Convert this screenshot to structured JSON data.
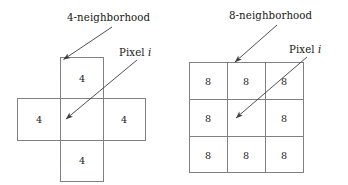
{
  "figure": {
    "background_color": "#ffffff",
    "line_color": "#808080",
    "arrow_color": "#3c3c3c",
    "text_color": "#161616"
  },
  "left_diagram": {
    "name": "4-neighborhood",
    "shape": "plus",
    "caption": "4-neighborhood",
    "pixel_caption_prefix": "Pixel ",
    "pixel_caption_symbol": "i",
    "center_value": "",
    "neighbor_value": "4",
    "cells": [
      {
        "position": "top",
        "label": "4"
      },
      {
        "position": "left",
        "label": "4"
      },
      {
        "position": "center",
        "label": ""
      },
      {
        "position": "right",
        "label": "4"
      },
      {
        "position": "bottom",
        "label": "4"
      }
    ],
    "annotations": [
      {
        "name": "neighborhood-arrow",
        "target": "top cell upper-left corner"
      },
      {
        "name": "pixel-arrow",
        "target": "center cell"
      }
    ]
  },
  "right_diagram": {
    "name": "8-neighborhood",
    "shape": "square-3x3",
    "caption": "8-neighborhood",
    "pixel_caption_prefix": "Pixel ",
    "pixel_caption_symbol": "i",
    "center_value": "",
    "neighbor_value": "8",
    "rows": [
      [
        "8",
        "8",
        "8"
      ],
      [
        "8",
        "",
        "8"
      ],
      [
        "8",
        "8",
        "8"
      ]
    ],
    "annotations": [
      {
        "name": "neighborhood-arrow",
        "target": "top-middle cell"
      },
      {
        "name": "pixel-arrow",
        "target": "center cell"
      }
    ]
  }
}
